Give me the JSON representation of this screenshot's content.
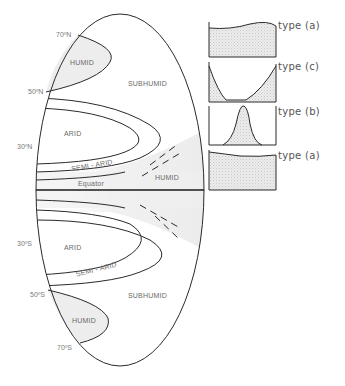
{
  "diagram": {
    "regions": {
      "humid_north": "HUMID",
      "subhumid_north": "SUBHUMID",
      "arid_north": "ARID",
      "semi_arid_north": "SEMI - ARID",
      "equator": "Equator",
      "humid_equatorial": "HUMID",
      "arid_south": "ARID",
      "semi_arid_south": "SEMI - ARID",
      "subhumid_south": "SUBHUMID",
      "humid_south": "HUMID"
    },
    "latitudes": {
      "n70": "70ºN",
      "n50": "50ºN",
      "n30": "30ºN",
      "s30": "30ºS",
      "s50": "50ºS",
      "s70": "70ºS"
    },
    "regime_types": [
      {
        "label": "type (a)",
        "shape": "flat-high"
      },
      {
        "label": "type (c)",
        "shape": "u-shaped"
      },
      {
        "label": "type (b)",
        "shape": "single-peak"
      },
      {
        "label": "type (a)",
        "shape": "flat-high"
      }
    ],
    "colors": {
      "line": "#2a2a2a",
      "fill_shade": "#e6e6e6",
      "text": "#6a6a6a"
    }
  }
}
